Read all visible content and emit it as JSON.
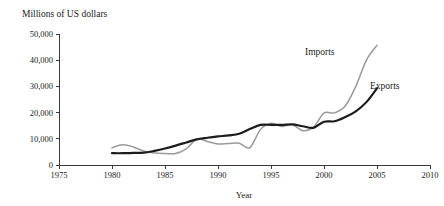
{
  "figure": {
    "unit_caption": "Millions of US dollars",
    "x_axis_title": "Year",
    "background_color": "#ffffff"
  },
  "chart_data": {
    "type": "line",
    "title": "Millions of US dollars",
    "xlabel": "Year",
    "ylabel": "Millions of US dollars",
    "xlim": [
      1975,
      2010
    ],
    "ylim": [
      0,
      50000
    ],
    "grid": false,
    "legend": "inline-labels",
    "x_ticks": [
      1975,
      1980,
      1985,
      1990,
      1995,
      2000,
      2005,
      2010
    ],
    "x_tick_labels": [
      "1975",
      "1980",
      "1985",
      "1990",
      "1995",
      "2000",
      "2005",
      "2010"
    ],
    "y_ticks": [
      0,
      10000,
      20000,
      30000,
      40000,
      50000
    ],
    "y_tick_labels": [
      "0",
      "10,000",
      "20,000",
      "30,000",
      "40,000",
      "50,000"
    ],
    "x": [
      1980,
      1981,
      1982,
      1983,
      1984,
      1985,
      1986,
      1987,
      1988,
      1989,
      1990,
      1991,
      1992,
      1993,
      1994,
      1995,
      1996,
      1997,
      1998,
      1999,
      2000,
      2001,
      2002,
      2003,
      2004,
      2005
    ],
    "series": [
      {
        "name": "Imports",
        "label": "Imports",
        "color": "#9a9a9a",
        "stroke_width": 1.5,
        "values": [
          6600,
          7700,
          6900,
          5300,
          4600,
          4400,
          4400,
          6200,
          9800,
          9000,
          8000,
          8200,
          8300,
          6600,
          13500,
          15900,
          14700,
          15400,
          13100,
          14400,
          19800,
          19900,
          22500,
          30000,
          40000,
          45700
        ]
      },
      {
        "name": "Exports",
        "label": "Exports",
        "color": "#1c1c1c",
        "stroke_width": 2.2,
        "values": [
          4500,
          4500,
          4600,
          4700,
          5400,
          6300,
          7400,
          8600,
          9800,
          10400,
          10900,
          11300,
          11900,
          13700,
          15300,
          15300,
          15300,
          15500,
          14800,
          14200,
          16500,
          16700,
          18300,
          20500,
          24000,
          29300
        ]
      }
    ],
    "series_label_positions": [
      {
        "name": "Imports",
        "x_px": 305,
        "y_px": 55
      },
      {
        "name": "Exports",
        "x_px": 370,
        "y_px": 89
      }
    ]
  },
  "geometry": {
    "plot_left_px": 59,
    "plot_right_px": 430,
    "plot_baseline_px": 165,
    "plot_top_px": 34
  }
}
